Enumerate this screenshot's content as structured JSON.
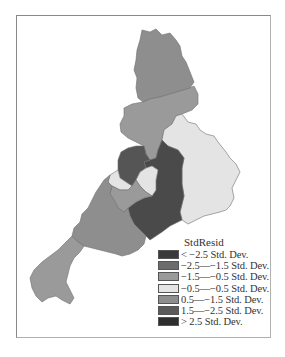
{
  "map": {
    "legend": {
      "title": "StdResid",
      "items": [
        {
          "label": "< −2.5 Std. Dev.",
          "color": "#3a3a3a"
        },
        {
          "label": "−2.5—−1.5 Std. Dev.",
          "color": "#6c6c6c"
        },
        {
          "label": "−1.5—−0.5 Std. Dev.",
          "color": "#9a9a9a"
        },
        {
          "label": "−0.5—−0.5 Std. Dev.",
          "color": "#e4e4e4"
        },
        {
          "label": "0.5—−1.5 Std. Dev.",
          "color": "#8e8e8e"
        },
        {
          "label": "1.5—−2.5 Std. Dev.",
          "color": "#5a5a5a"
        },
        {
          "label": "> 2.5 Std. Dev.",
          "color": "#2e2e2e"
        }
      ]
    },
    "regions": [
      {
        "name": "north",
        "class": "0.5~1.5",
        "color": "#8e8e8e"
      },
      {
        "name": "north-central",
        "class": "-1.5~-0.5",
        "color": "#9a9a9a"
      },
      {
        "name": "east",
        "class": "-0.5~0.5",
        "color": "#e4e4e4"
      },
      {
        "name": "central-west-dark",
        "class": "1.5~2.5",
        "color": "#555555"
      },
      {
        "name": "central-dark",
        "class": "1.5~2.5",
        "color": "#4a4a4a"
      },
      {
        "name": "small-light-west",
        "class": "-0.5~0.5",
        "color": "#e4e4e4"
      },
      {
        "name": "small-light-center",
        "class": "-0.5~0.5",
        "color": "#e4e4e4"
      },
      {
        "name": "mid-gray",
        "class": "-1.5~-0.5",
        "color": "#9a9a9a"
      },
      {
        "name": "south-west",
        "class": "0.5~1.5",
        "color": "#8e8e8e"
      },
      {
        "name": "far-south-west",
        "class": "-1.5~-0.5",
        "color": "#9a9a9a"
      }
    ]
  }
}
